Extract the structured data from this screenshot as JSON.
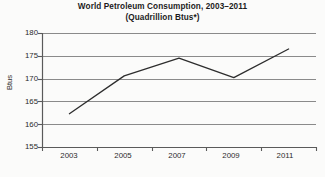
{
  "chart_data": {
    "type": "line",
    "title": "World Petroleum Consumption, 2003–2011",
    "subtitle": "(Quadrillion Btus*)",
    "xlabel": "",
    "ylabel": "Btus",
    "x": [
      2003,
      2005,
      2007,
      2009,
      2011
    ],
    "values": [
      162.3,
      170.6,
      174.5,
      170.2,
      176.5
    ],
    "series": [
      {
        "name": "World Petroleum Consumption",
        "values": [
          162.3,
          170.6,
          174.5,
          170.2,
          176.5
        ]
      }
    ],
    "categories": [
      "2003",
      "2005",
      "2007",
      "2009",
      "2011"
    ],
    "ylim": [
      155,
      180
    ],
    "yticks": [
      155,
      160,
      165,
      170,
      175,
      180
    ],
    "ytick_labels": [
      "155",
      "160",
      "165",
      "170",
      "175",
      "180"
    ],
    "xtick_labels": [
      "2003",
      "2005",
      "2007",
      "2009",
      "2011"
    ],
    "grid": true,
    "grid_axis": "y",
    "legend": false,
    "legend_position": "none",
    "colors": {
      "line": "#2d2d2d",
      "grid": "#8a8a8a",
      "axis": "#5a5a5a",
      "background": "#fbfbfa",
      "text": "#2b2b2b"
    }
  }
}
